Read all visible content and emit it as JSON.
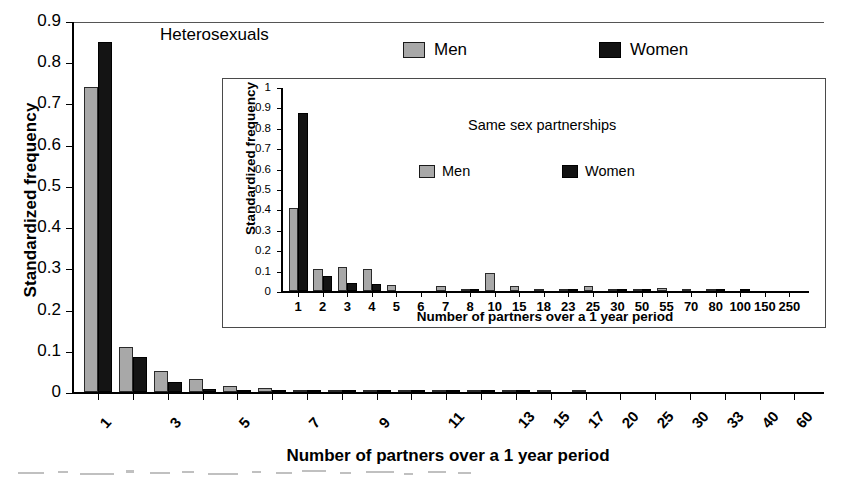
{
  "figure": {
    "background": "#ffffff",
    "colors": {
      "men": "#a8a8a8",
      "women": "#141414",
      "axis": "#000000"
    }
  },
  "main": {
    "title": "Heterosexuals",
    "ylabel": "Standardized frequency",
    "xlabel": "Number of partners over a 1 year period",
    "legend": {
      "men": "Men",
      "women": "Women"
    },
    "yticks": [
      "0.9",
      "0.8",
      "0.7",
      "0.6",
      "0.5",
      "0.4",
      "0.3",
      "0.2",
      "0.1",
      "0"
    ]
  },
  "inset": {
    "title": "Same sex partnerships",
    "ylabel": "Standardized frequency",
    "xlabel": "Number of partners over a 1 year period",
    "legend": {
      "men": "Men",
      "women": "Women"
    },
    "yticks": [
      "1",
      "0.9",
      "0.8",
      "0.7",
      "0.6",
      "0.5",
      "0.4",
      "0.3",
      "0.2",
      "0.1",
      "0"
    ]
  },
  "chart_data": [
    {
      "id": "heterosexuals",
      "type": "bar",
      "title": "Heterosexuals",
      "xlabel": "Number of partners over a 1 year period",
      "ylabel": "Standardized frequency",
      "ylim": [
        0,
        0.9
      ],
      "ytick_values": [
        0,
        0.1,
        0.2,
        0.3,
        0.4,
        0.5,
        0.6,
        0.7,
        0.8,
        0.9
      ],
      "grid": false,
      "legend_position": "top-right",
      "categories": [
        "1",
        "2",
        "3",
        "4",
        "5",
        "6",
        "7",
        "8",
        "9",
        "10",
        "11",
        "12",
        "13",
        "15",
        "17",
        "20",
        "25",
        "30",
        "33",
        "40",
        "60"
      ],
      "tick_labels_shown": [
        "1",
        "3",
        "5",
        "7",
        "9",
        "11",
        "13",
        "15",
        "17",
        "20",
        "25",
        "30",
        "33",
        "40",
        "60"
      ],
      "series": [
        {
          "name": "Men",
          "color": "#a8a8a8",
          "values": [
            0.74,
            0.11,
            0.052,
            0.032,
            0.014,
            0.009,
            0.006,
            0.004,
            0.003,
            0.003,
            0.002,
            0.002,
            0.001,
            0.001,
            0.001,
            0.0,
            0.0,
            0.0,
            0.0,
            0.0,
            0.0
          ]
        },
        {
          "name": "Women",
          "color": "#141414",
          "values": [
            0.85,
            0.084,
            0.024,
            0.008,
            0.005,
            0.004,
            0.003,
            0.003,
            0.002,
            0.002,
            0.002,
            0.001,
            0.003,
            0.0,
            0.0,
            0.0,
            0.0,
            0.0,
            0.0,
            0.0,
            0.0
          ]
        }
      ]
    },
    {
      "id": "same-sex-partnerships",
      "type": "bar",
      "title": "Same sex partnerships",
      "xlabel": "Number of partners over a 1 year period",
      "ylabel": "Standardized frequency",
      "ylim": [
        0,
        1
      ],
      "ytick_values": [
        0,
        0.1,
        0.2,
        0.3,
        0.4,
        0.5,
        0.6,
        0.7,
        0.8,
        0.9,
        1
      ],
      "grid": false,
      "legend_position": "top-right",
      "categories": [
        "1",
        "2",
        "3",
        "4",
        "5",
        "6",
        "7",
        "8",
        "10",
        "15",
        "18",
        "23",
        "25",
        "30",
        "50",
        "55",
        "70",
        "80",
        "100",
        "150",
        "250"
      ],
      "series": [
        {
          "name": "Men",
          "color": "#a8a8a8",
          "values": [
            0.405,
            0.108,
            0.117,
            0.107,
            0.03,
            0.0,
            0.027,
            0.004,
            0.087,
            0.027,
            0.002,
            0.004,
            0.026,
            0.004,
            0.003,
            0.016,
            0.003,
            0.004,
            0.0,
            0.0,
            0.0
          ]
        },
        {
          "name": "Women",
          "color": "#141414",
          "values": [
            0.875,
            0.075,
            0.037,
            0.036,
            0.0,
            0.0,
            0.0,
            0.007,
            0.0,
            0.0,
            0.0,
            0.008,
            0.0,
            0.004,
            0.005,
            0.0,
            0.0,
            0.003,
            0.004,
            0.0,
            0.0
          ]
        }
      ]
    }
  ]
}
